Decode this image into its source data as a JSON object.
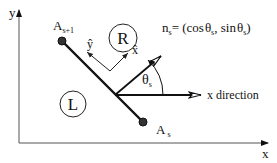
{
  "diagram": {
    "axes": {
      "x_label": "x",
      "y_label": "y"
    },
    "points": {
      "start": {
        "label": "A",
        "subscript": "s+1"
      },
      "end": {
        "label": "A",
        "subscript": "s"
      }
    },
    "regions": {
      "right": "R",
      "left": "L"
    },
    "local_axes": {
      "x_hat": "x̂",
      "y_hat": "ŷ"
    },
    "normal": {
      "label_main": "n",
      "label_sub": "s",
      "equation_prefix": "= (cos",
      "theta": "θ",
      "theta_sub": "s",
      "equation_mid": ", sin",
      "equation_suffix": ")"
    },
    "angle": {
      "symbol": "θ",
      "subscript": "s"
    },
    "x_direction_label": "x direction",
    "colors": {
      "line": "#111111",
      "axis": "#555555",
      "background": "#ffffff"
    }
  }
}
